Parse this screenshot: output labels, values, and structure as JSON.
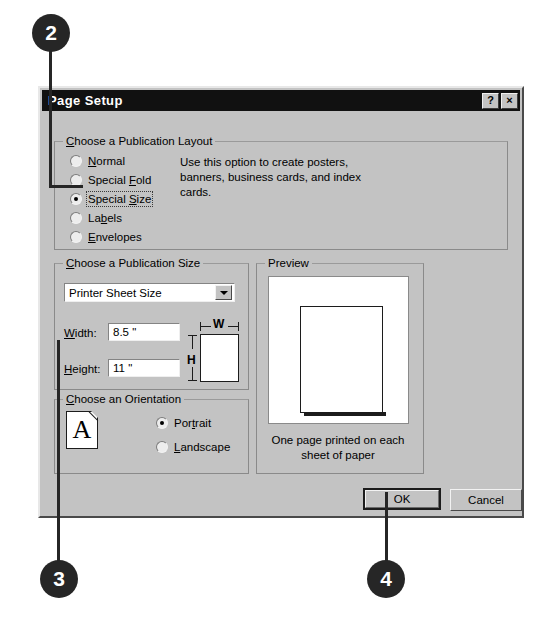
{
  "callouts": [
    {
      "number": "2"
    },
    {
      "number": "3"
    },
    {
      "number": "4"
    }
  ],
  "dialog": {
    "title": "Page Setup",
    "help_button": "?",
    "close_button": "×",
    "layout_group": {
      "title": "Choose a Publication Layout",
      "options": [
        {
          "label": "Normal",
          "accel": "N",
          "selected": false
        },
        {
          "label": "Special Fold",
          "accel": "F",
          "selected": false
        },
        {
          "label": "Special Size",
          "accel": "S",
          "selected": true
        },
        {
          "label": "Labels",
          "accel": "b",
          "selected": false
        },
        {
          "label": "Envelopes",
          "accel": "E",
          "selected": false
        }
      ],
      "description": "Use this option to create posters, banners, business cards, and index cards."
    },
    "size_group": {
      "title": "Choose a Publication Size",
      "combo_value": "Printer Sheet Size",
      "width_label": "Width:",
      "width_value": "8.5 \"",
      "height_label": "Height:",
      "height_value": "11 \"",
      "diagram_width_label": "W",
      "diagram_height_label": "H"
    },
    "orientation_group": {
      "title": "Choose an Orientation",
      "icon_letter": "A",
      "options": [
        {
          "label": "Portrait",
          "accel": "t",
          "selected": true
        },
        {
          "label": "Landscape",
          "accel": "L",
          "selected": false
        }
      ]
    },
    "preview_group": {
      "title": "Preview",
      "caption": "One page printed on each sheet of paper"
    },
    "buttons": {
      "ok": "OK",
      "cancel": "Cancel"
    }
  },
  "colors": {
    "dialog_face": "#c3c3c3",
    "titlebar": "#111111",
    "callout": "#262626"
  }
}
